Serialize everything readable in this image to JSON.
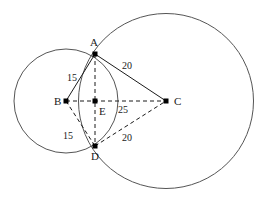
{
  "figure": {
    "width": 265,
    "height": 202,
    "background_color": "#ffffff",
    "stroke_color": "#1a1a1a",
    "circle_color": "#555555"
  },
  "points": [
    {
      "id": "A",
      "label": "A",
      "x": 95,
      "y": 54,
      "label_x": 90,
      "label_y": 46,
      "dot": true
    },
    {
      "id": "B",
      "label": "B",
      "x": 66,
      "y": 101,
      "label_x": 54,
      "label_y": 105,
      "dot": true
    },
    {
      "id": "C",
      "label": "C",
      "x": 166,
      "y": 101,
      "label_x": 174,
      "label_y": 105,
      "dot": true
    },
    {
      "id": "D",
      "label": "D",
      "x": 95,
      "y": 146,
      "label_x": 91,
      "label_y": 160,
      "dot": true
    },
    {
      "id": "E",
      "label": "E",
      "x": 95,
      "y": 101,
      "label_x": 99,
      "label_y": 115,
      "dot": true
    }
  ],
  "circles": [
    {
      "id": "circle-B",
      "center": "B",
      "cx": 66,
      "cy": 101,
      "r": 52
    },
    {
      "id": "circle-C",
      "center": "C",
      "cx": 166,
      "cy": 101,
      "r": 87.5
    }
  ],
  "segments": [
    {
      "id": "BA",
      "from": "B",
      "to": "A",
      "style": "solid",
      "x1": 66,
      "y1": 101,
      "x2": 95,
      "y2": 54
    },
    {
      "id": "AC",
      "from": "A",
      "to": "C",
      "style": "solid",
      "x1": 95,
      "y1": 54,
      "x2": 166,
      "y2": 101
    },
    {
      "id": "BD",
      "from": "B",
      "to": "D",
      "style": "dashed",
      "x1": 66,
      "y1": 101,
      "x2": 95,
      "y2": 146
    },
    {
      "id": "DC",
      "from": "D",
      "to": "C",
      "style": "dashed",
      "x1": 95,
      "y1": 146,
      "x2": 166,
      "y2": 101
    },
    {
      "id": "BC",
      "from": "B",
      "to": "C",
      "style": "dashed",
      "x1": 66,
      "y1": 101,
      "x2": 166,
      "y2": 101
    },
    {
      "id": "AD",
      "from": "A",
      "to": "D",
      "style": "dashed",
      "x1": 95,
      "y1": 54,
      "x2": 95,
      "y2": 146
    }
  ],
  "measurements": [
    {
      "id": "len-BA",
      "segment": "BA",
      "value": "15",
      "x": 72,
      "y": 81
    },
    {
      "id": "len-AC",
      "segment": "AC",
      "value": "20",
      "x": 127,
      "y": 69
    },
    {
      "id": "len-BC",
      "segment": "BC",
      "value": "25",
      "x": 123,
      "y": 113
    },
    {
      "id": "len-BD",
      "segment": "BD",
      "value": "15",
      "x": 68,
      "y": 139
    },
    {
      "id": "len-DC",
      "segment": "DC",
      "value": "20",
      "x": 127,
      "y": 141
    }
  ]
}
